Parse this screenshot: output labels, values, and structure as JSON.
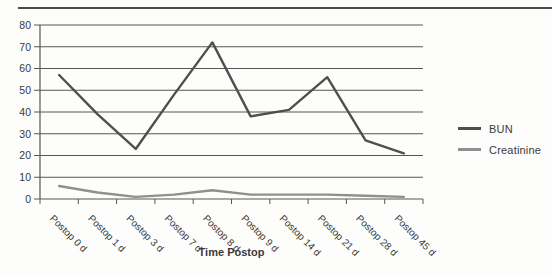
{
  "figure": {
    "background": "#fdfdfb",
    "text_color": "#3a3a3a",
    "grid_color": "#565656",
    "top_rule_color": "#4b4b4b"
  },
  "chart_data": {
    "type": "line",
    "title": "",
    "xlabel": "Time Postop",
    "ylabel": "",
    "ylim": [
      0,
      80
    ],
    "yticks": [
      0,
      10,
      20,
      30,
      40,
      50,
      60,
      70,
      80
    ],
    "grid": "horizontal gridlines at every ytick",
    "legend_position": "right of plot area",
    "categories": [
      "Postop 0 d",
      "Postop 1 d",
      "Postop 3 d",
      "Postop 7 d",
      "Postop 8 d",
      "Postop 9 d",
      "Postop 14 d",
      "Postop 21 d",
      "Postop 28 d",
      "Postop 45 d"
    ],
    "series": [
      {
        "name": "BUN",
        "color": "#4f4f4f",
        "values": [
          57,
          39,
          23,
          48,
          72,
          38,
          41,
          56,
          27,
          21
        ]
      },
      {
        "name": "Creatinine",
        "color": "#8f8f8f",
        "values": [
          6,
          3,
          1,
          2,
          4,
          2,
          2,
          2,
          1.5,
          1
        ]
      }
    ]
  }
}
